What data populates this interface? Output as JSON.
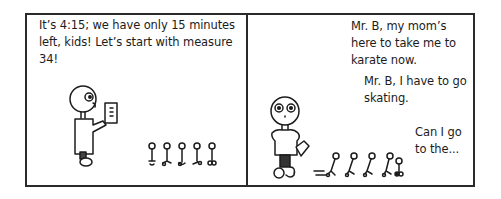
{
  "comic": {
    "panels": [
      {
        "caption": "It’s 4:15; we have only 15 minutes left, kids! Let’s start with measure 34!",
        "characters": [
          "teacher-holding-sheet-music",
          "row-of-five-small-stick-figure-students"
        ]
      },
      {
        "captions": [
          "Mr. B, my mom’s here to take me to karate now.",
          "Mr. B, I have to go skating.",
          "Can I go to the..."
        ],
        "characters": [
          "teacher-front-facing-holding-sheet",
          "small-stick-figure-students-running-away"
        ]
      }
    ],
    "colors": {
      "ink": "#1c1c1c",
      "border": "#2a2a2a",
      "background": "#ffffff"
    }
  }
}
